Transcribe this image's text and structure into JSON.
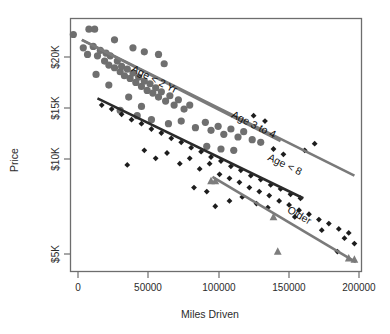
{
  "chart_data": {
    "type": "scatter",
    "title": "",
    "xlabel": "Miles Driven",
    "ylabel": "Price",
    "xlim": [
      0,
      205000
    ],
    "ylim": [
      3800,
      22800
    ],
    "grid": false,
    "legend_position": "inline-along-lines",
    "xticks": [
      "0",
      "50000",
      "100000",
      "150000",
      "200000"
    ],
    "xtick_values": [
      0,
      50000,
      100000,
      150000,
      200000
    ],
    "yticks": [
      "$5K",
      "$10K",
      "$15K",
      "$20K"
    ],
    "ytick_values": [
      5000,
      10000,
      15000,
      20000
    ],
    "series": [
      {
        "name": "Age < 2 Yr",
        "marker": "circle",
        "color": "#6f6f6f",
        "trendline": {
          "x0": 8000,
          "y0": 21200,
          "x1": 148000,
          "y1": 13600
        },
        "label_anchor": {
          "x": 58000,
          "y": 18000
        },
        "points": [
          {
            "x": 2000,
            "y": 21600
          },
          {
            "x": 13000,
            "y": 22000
          },
          {
            "x": 17000,
            "y": 22000
          },
          {
            "x": 9000,
            "y": 20600
          },
          {
            "x": 12000,
            "y": 20100
          },
          {
            "x": 16000,
            "y": 20700
          },
          {
            "x": 19000,
            "y": 20000
          },
          {
            "x": 21000,
            "y": 20400
          },
          {
            "x": 24000,
            "y": 19600
          },
          {
            "x": 25000,
            "y": 20200
          },
          {
            "x": 27000,
            "y": 19300
          },
          {
            "x": 28000,
            "y": 20000
          },
          {
            "x": 31000,
            "y": 19100
          },
          {
            "x": 33000,
            "y": 19600
          },
          {
            "x": 35000,
            "y": 18800
          },
          {
            "x": 36000,
            "y": 19200
          },
          {
            "x": 38000,
            "y": 18500
          },
          {
            "x": 40000,
            "y": 19000
          },
          {
            "x": 42000,
            "y": 18300
          },
          {
            "x": 44000,
            "y": 18700
          },
          {
            "x": 46000,
            "y": 18000
          },
          {
            "x": 48000,
            "y": 18400
          },
          {
            "x": 50000,
            "y": 17700
          },
          {
            "x": 52000,
            "y": 18100
          },
          {
            "x": 54000,
            "y": 17400
          },
          {
            "x": 56000,
            "y": 17900
          },
          {
            "x": 58000,
            "y": 17200
          },
          {
            "x": 60000,
            "y": 17600
          },
          {
            "x": 62000,
            "y": 16900
          },
          {
            "x": 64000,
            "y": 17300
          },
          {
            "x": 67000,
            "y": 16600
          },
          {
            "x": 70000,
            "y": 17000
          },
          {
            "x": 73000,
            "y": 16300
          },
          {
            "x": 76000,
            "y": 16700
          },
          {
            "x": 80000,
            "y": 16000
          },
          {
            "x": 84000,
            "y": 16300
          },
          {
            "x": 31000,
            "y": 21200
          },
          {
            "x": 44000,
            "y": 20600
          },
          {
            "x": 52000,
            "y": 20300
          },
          {
            "x": 62000,
            "y": 20100
          },
          {
            "x": 66000,
            "y": 19400
          },
          {
            "x": 18000,
            "y": 18600
          },
          {
            "x": 27000,
            "y": 17800
          },
          {
            "x": 41000,
            "y": 16900
          },
          {
            "x": 50000,
            "y": 16200
          },
          {
            "x": 35000,
            "y": 15900
          },
          {
            "x": 47000,
            "y": 15500
          },
          {
            "x": 57000,
            "y": 15200
          },
          {
            "x": 69000,
            "y": 14900
          },
          {
            "x": 78000,
            "y": 15100
          },
          {
            "x": 88000,
            "y": 14600
          },
          {
            "x": 95000,
            "y": 15000
          },
          {
            "x": 99000,
            "y": 14400
          },
          {
            "x": 104000,
            "y": 14700
          },
          {
            "x": 108000,
            "y": 14100
          },
          {
            "x": 113000,
            "y": 14500
          },
          {
            "x": 118000,
            "y": 13900
          },
          {
            "x": 122000,
            "y": 14300
          },
          {
            "x": 128000,
            "y": 13700
          },
          {
            "x": 134000,
            "y": 13500
          },
          {
            "x": 96000,
            "y": 13200
          },
          {
            "x": 106000,
            "y": 13000
          },
          {
            "x": 115000,
            "y": 12900
          }
        ]
      },
      {
        "name": "Age 3 to 4",
        "marker": "circle",
        "color": "#6f6f6f",
        "trendline": {
          "x0": 8000,
          "y0": 21200,
          "x1": 200000,
          "y1": 11000
        },
        "label_anchor": {
          "x": 128000,
          "y": 14600
        },
        "points": []
      },
      {
        "name": "Age < 8",
        "marker": "diamond",
        "color": "#1d1d1d",
        "trendline": {
          "x0": 19000,
          "y0": 16800,
          "x1": 164000,
          "y1": 9300
        },
        "label_anchor": {
          "x": 150000,
          "y": 11600
        },
        "points": [
          {
            "x": 22000,
            "y": 16300
          },
          {
            "x": 29000,
            "y": 16000
          },
          {
            "x": 36000,
            "y": 15600
          },
          {
            "x": 43000,
            "y": 15200
          },
          {
            "x": 50000,
            "y": 14900
          },
          {
            "x": 57000,
            "y": 14500
          },
          {
            "x": 64000,
            "y": 14200
          },
          {
            "x": 71000,
            "y": 13800
          },
          {
            "x": 78000,
            "y": 13500
          },
          {
            "x": 85000,
            "y": 13100
          },
          {
            "x": 92000,
            "y": 12800
          },
          {
            "x": 99000,
            "y": 12400
          },
          {
            "x": 106000,
            "y": 12100
          },
          {
            "x": 113000,
            "y": 11700
          },
          {
            "x": 120000,
            "y": 11400
          },
          {
            "x": 127000,
            "y": 11000
          },
          {
            "x": 134000,
            "y": 10700
          },
          {
            "x": 141000,
            "y": 10300
          },
          {
            "x": 148000,
            "y": 10000
          },
          {
            "x": 155000,
            "y": 9600
          },
          {
            "x": 162000,
            "y": 9300
          },
          {
            "x": 40000,
            "y": 11800
          },
          {
            "x": 52000,
            "y": 12900
          },
          {
            "x": 60000,
            "y": 12300
          },
          {
            "x": 68000,
            "y": 12700
          },
          {
            "x": 77000,
            "y": 11900
          },
          {
            "x": 84000,
            "y": 12300
          },
          {
            "x": 91000,
            "y": 11500
          },
          {
            "x": 98000,
            "y": 11900
          },
          {
            "x": 105000,
            "y": 11100
          },
          {
            "x": 112000,
            "y": 10800
          },
          {
            "x": 119000,
            "y": 10500
          },
          {
            "x": 126000,
            "y": 10100
          },
          {
            "x": 133000,
            "y": 9800
          },
          {
            "x": 140000,
            "y": 9500
          },
          {
            "x": 147000,
            "y": 9100
          },
          {
            "x": 154000,
            "y": 8800
          },
          {
            "x": 161000,
            "y": 8400
          },
          {
            "x": 168000,
            "y": 8100
          },
          {
            "x": 175000,
            "y": 7700
          },
          {
            "x": 182000,
            "y": 7400
          },
          {
            "x": 189000,
            "y": 7000
          },
          {
            "x": 196000,
            "y": 6700
          },
          {
            "x": 165000,
            "y": 12900
          },
          {
            "x": 172000,
            "y": 13400
          },
          {
            "x": 150000,
            "y": 12600
          },
          {
            "x": 143000,
            "y": 13000
          },
          {
            "x": 87000,
            "y": 10100
          },
          {
            "x": 96000,
            "y": 9800
          },
          {
            "x": 121000,
            "y": 9400
          },
          {
            "x": 112000,
            "y": 9100
          },
          {
            "x": 102000,
            "y": 8700
          },
          {
            "x": 131000,
            "y": 8900
          },
          {
            "x": 139000,
            "y": 8600
          },
          {
            "x": 158000,
            "y": 7900
          },
          {
            "x": 177000,
            "y": 6900
          },
          {
            "x": 193000,
            "y": 6300
          },
          {
            "x": 200000,
            "y": 5900
          },
          {
            "x": 129000,
            "y": 15500
          },
          {
            "x": 137000,
            "y": 15100
          },
          {
            "x": 188000,
            "y": 5300
          }
        ]
      },
      {
        "name": "Older",
        "marker": "triangle",
        "color": "#7d7d7d",
        "trendline": {
          "x0": 100000,
          "y0": 10900,
          "x1": 201000,
          "y1": 4500
        },
        "label_anchor": {
          "x": 160000,
          "y": 7800
        },
        "points": [
          {
            "x": 99000,
            "y": 10600
          },
          {
            "x": 102000,
            "y": 10600
          },
          {
            "x": 143000,
            "y": 7900
          },
          {
            "x": 146000,
            "y": 5300
          },
          {
            "x": 196000,
            "y": 4800
          },
          {
            "x": 200000,
            "y": 4700
          }
        ]
      }
    ]
  }
}
